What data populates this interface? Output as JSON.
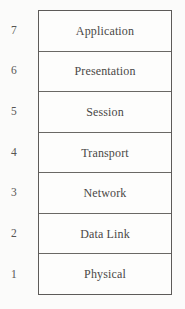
{
  "diagram": {
    "layers": [
      {
        "number": "7",
        "name": "Application"
      },
      {
        "number": "6",
        "name": "Presentation"
      },
      {
        "number": "5",
        "name": "Session"
      },
      {
        "number": "4",
        "name": "Transport"
      },
      {
        "number": "3",
        "name": "Network"
      },
      {
        "number": "2",
        "name": "Data Link"
      },
      {
        "number": "1",
        "name": "Physical"
      }
    ],
    "colors": {
      "background": "#fbfbfa",
      "box_fill": "#fdfdfc",
      "border": "#5d5b59",
      "divider": "#6a6865",
      "label_text": "#4a4846",
      "number_text": "#575553"
    }
  }
}
